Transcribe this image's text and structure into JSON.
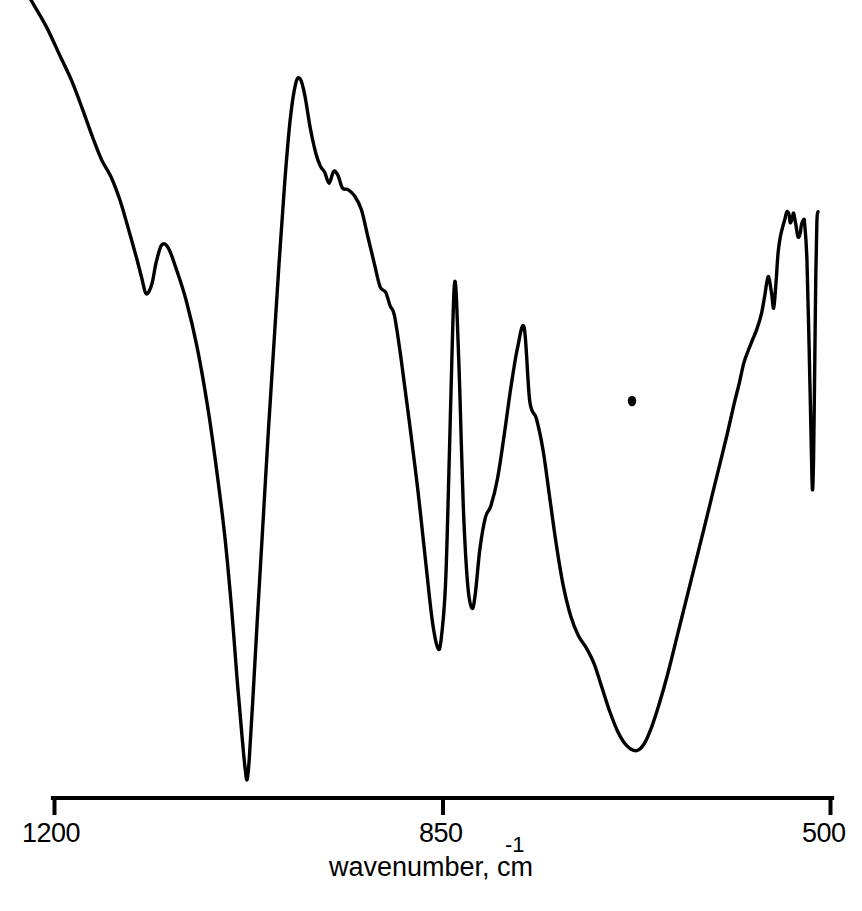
{
  "figure": {
    "kind": "infrared-absorbance-spectrum",
    "background_color": "#ffffff",
    "trace_color": "#000000"
  },
  "axis": {
    "title_text": "wavenumber, cm",
    "title_exponent": "-1",
    "tick_labels": [
      "1200",
      "850",
      "500"
    ],
    "tick_values": [
      1200,
      850,
      500
    ],
    "left_label": "1200",
    "mid_label": "850",
    "right_label": "500"
  },
  "chart_data": {
    "type": "line",
    "title": "",
    "subtitle": "",
    "xlabel": "wavenumber, cm-1",
    "ylabel": "",
    "xlim": [
      1200,
      500
    ],
    "ylim": [
      0,
      1
    ],
    "x_axis_inverted": true,
    "grid": false,
    "legend": null,
    "tick_labels": [
      "1200",
      "850",
      "500"
    ],
    "tick_values": [
      1200,
      850,
      500
    ],
    "series": [
      {
        "name": "transmittance trace",
        "note": "y given as normalized signal height, 1 = top of plot frame, 0 = bottom of plot frame; x in cm-1",
        "points": [
          [
            1210,
            1.0
          ],
          [
            1196,
            0.966
          ],
          [
            1184,
            0.93
          ],
          [
            1173,
            0.897
          ],
          [
            1163,
            0.86
          ],
          [
            1154,
            0.825
          ],
          [
            1146,
            0.797
          ],
          [
            1138,
            0.777
          ],
          [
            1130,
            0.748
          ],
          [
            1122,
            0.71
          ],
          [
            1115,
            0.675
          ],
          [
            1110,
            0.648
          ],
          [
            1106,
            0.628
          ],
          [
            1101,
            0.64
          ],
          [
            1097,
            0.668
          ],
          [
            1092,
            0.69
          ],
          [
            1086,
            0.686
          ],
          [
            1079,
            0.66
          ],
          [
            1070,
            0.62
          ],
          [
            1060,
            0.56
          ],
          [
            1050,
            0.48
          ],
          [
            1042,
            0.4
          ],
          [
            1035,
            0.32
          ],
          [
            1029,
            0.23
          ],
          [
            1024,
            0.14
          ],
          [
            1020,
            0.075
          ],
          [
            1017,
            0.03
          ],
          [
            1015,
            0.013
          ],
          [
            1013,
            0.04
          ],
          [
            1010,
            0.11
          ],
          [
            1006,
            0.21
          ],
          [
            1001,
            0.33
          ],
          [
            996,
            0.45
          ],
          [
            991,
            0.56
          ],
          [
            986,
            0.67
          ],
          [
            981,
            0.77
          ],
          [
            976,
            0.85
          ],
          [
            971,
            0.895
          ],
          [
            967,
            0.9
          ],
          [
            963,
            0.88
          ],
          [
            958,
            0.838
          ],
          [
            953,
            0.806
          ],
          [
            949,
            0.79
          ],
          [
            945,
            0.782
          ],
          [
            941,
            0.768
          ],
          [
            937,
            0.783
          ],
          [
            933,
            0.778
          ],
          [
            929,
            0.762
          ],
          [
            924,
            0.76
          ],
          [
            918,
            0.752
          ],
          [
            912,
            0.735
          ],
          [
            906,
            0.7
          ],
          [
            900,
            0.665
          ],
          [
            895,
            0.637
          ],
          [
            890,
            0.63
          ],
          [
            886,
            0.613
          ],
          [
            882,
            0.6
          ],
          [
            876,
            0.545
          ],
          [
            869,
            0.47
          ],
          [
            861,
            0.38
          ],
          [
            854,
            0.29
          ],
          [
            848,
            0.215
          ],
          [
            843,
            0.18
          ],
          [
            840,
            0.19
          ],
          [
            836,
            0.26
          ],
          [
            833,
            0.4
          ],
          [
            830,
            0.56
          ],
          [
            828,
            0.64
          ],
          [
            826,
            0.618
          ],
          [
            823,
            0.5
          ],
          [
            820,
            0.36
          ],
          [
            816,
            0.26
          ],
          [
            812,
            0.23
          ],
          [
            809,
            0.25
          ],
          [
            805,
            0.305
          ],
          [
            800,
            0.345
          ],
          [
            795,
            0.36
          ],
          [
            789,
            0.395
          ],
          [
            783,
            0.45
          ],
          [
            777,
            0.51
          ],
          [
            771,
            0.56
          ],
          [
            765,
            0.585
          ],
          [
            760,
            0.492
          ],
          [
            754,
            0.47
          ],
          [
            748,
            0.43
          ],
          [
            742,
            0.37
          ],
          [
            736,
            0.31
          ],
          [
            730,
            0.26
          ],
          [
            723,
            0.22
          ],
          [
            716,
            0.195
          ],
          [
            709,
            0.18
          ],
          [
            702,
            0.16
          ],
          [
            695,
            0.13
          ],
          [
            688,
            0.1
          ],
          [
            681,
            0.075
          ],
          [
            675,
            0.06
          ],
          [
            669,
            0.052
          ],
          [
            663,
            0.05
          ],
          [
            657,
            0.058
          ],
          [
            650,
            0.08
          ],
          [
            643,
            0.11
          ],
          [
            635,
            0.15
          ],
          [
            627,
            0.195
          ],
          [
            619,
            0.24
          ],
          [
            611,
            0.285
          ],
          [
            603,
            0.33
          ],
          [
            596,
            0.37
          ],
          [
            589,
            0.41
          ],
          [
            582,
            0.45
          ],
          [
            576,
            0.487
          ],
          [
            571,
            0.515
          ],
          [
            567,
            0.54
          ],
          [
            563,
            0.556
          ],
          [
            559,
            0.57
          ],
          [
            555,
            0.584
          ],
          [
            551,
            0.603
          ],
          [
            548,
            0.626
          ],
          [
            545,
            0.65
          ],
          [
            542,
            0.63
          ],
          [
            540,
            0.61
          ],
          [
            538,
            0.64
          ],
          [
            536,
            0.68
          ],
          [
            534,
            0.7
          ],
          [
            532,
            0.712
          ],
          [
            530,
            0.722
          ],
          [
            528,
            0.732
          ],
          [
            526,
            0.728
          ],
          [
            525,
            0.718
          ],
          [
            523,
            0.725
          ],
          [
            522,
            0.73
          ],
          [
            520,
            0.716
          ],
          [
            518,
            0.7
          ],
          [
            516,
            0.705
          ],
          [
            515,
            0.715
          ],
          [
            513,
            0.722
          ],
          [
            512,
            0.716
          ],
          [
            510,
            0.672
          ],
          [
            508,
            0.56
          ],
          [
            506,
            0.43
          ],
          [
            505,
            0.38
          ],
          [
            504,
            0.42
          ],
          [
            503,
            0.53
          ],
          [
            502,
            0.65
          ],
          [
            501,
            0.72
          ],
          [
            500,
            0.732
          ]
        ]
      }
    ],
    "annotations": []
  }
}
